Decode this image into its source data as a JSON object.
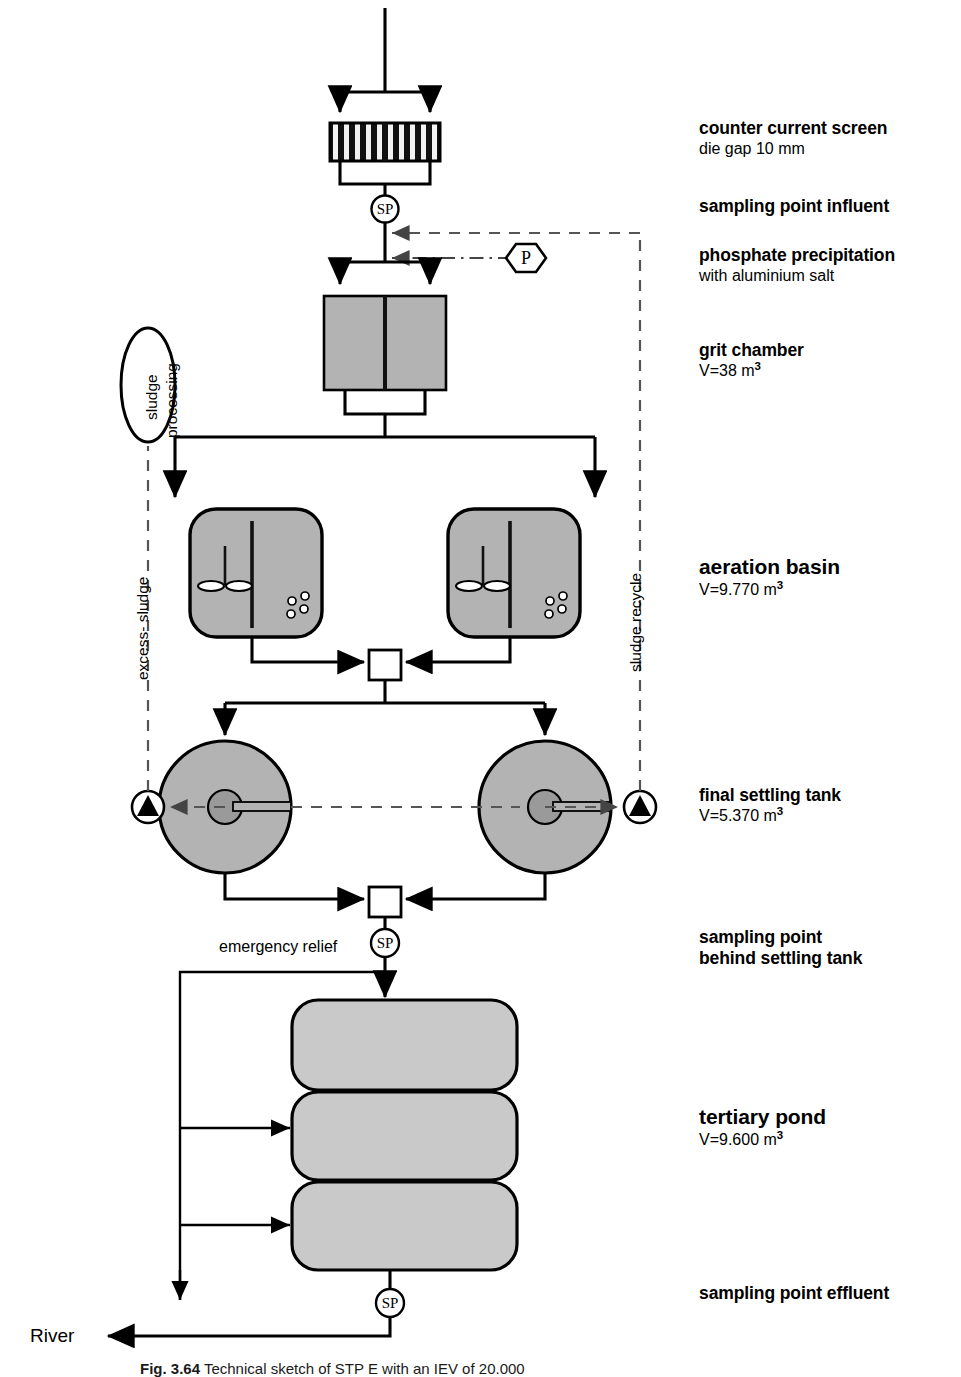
{
  "figure": {
    "caption_bold": "Fig. 3.64",
    "caption_rest": "Technical sketch of STP E with an IEV of 20.000"
  },
  "colors": {
    "tank_gray": "#b3b3b3",
    "pond_gray": "#c9c9c9",
    "line_black": "#000000",
    "dashed_gray": "#555555"
  },
  "right_labels": [
    {
      "title": "counter current screen",
      "sub": "die gap 10 mm",
      "size": "normal"
    },
    {
      "title": "sampling point influent",
      "sub": "",
      "size": "normal"
    },
    {
      "title": "phosphate precipitation",
      "sub": "with aluminium salt",
      "size": "normal"
    },
    {
      "title": "grit chamber",
      "sub": "V=38 m",
      "sup": "3",
      "size": "normal"
    },
    {
      "title": "aeration basin",
      "sub": "V=9.770 m",
      "sup": "3",
      "size": "big"
    },
    {
      "title": "final settling tank",
      "sub": "V=5.370 m",
      "sup": "3",
      "size": "normal"
    },
    {
      "title": "sampling point",
      "sub2": "behind settling tank",
      "size": "normal"
    },
    {
      "title": "tertiary pond",
      "sub": "V=9.600 m",
      "sup": "3",
      "size": "big"
    },
    {
      "title": "sampling point effluent",
      "sub": "",
      "size": "normal"
    }
  ],
  "diagram_labels": {
    "sludge_processing_line1": "sludge",
    "sludge_processing_line2": "processing",
    "excess_sludge": "excess- sludge",
    "sludge_recycle": "sludge recycle",
    "emergency_relief": "emergency relief",
    "river": "River",
    "phosphate_node": "P",
    "sampling_point_symbol": "SP"
  },
  "nodes": {
    "screen": "counter-current-screen",
    "grit_chamber": "grit-chamber",
    "aeration_basin_left": "aeration-basin-left",
    "aeration_basin_right": "aeration-basin-right",
    "settling_tank_left": "final-settling-tank-left",
    "settling_tank_right": "final-settling-tank-right",
    "tertiary_pond_1": "tertiary-pond-1",
    "tertiary_pond_2": "tertiary-pond-2",
    "tertiary_pond_3": "tertiary-pond-3",
    "pump_left": "sludge-pump-left",
    "pump_right": "sludge-pump-right",
    "splitter_aeration": "distribution-box-aeration",
    "splitter_settling": "distribution-box-settling"
  }
}
